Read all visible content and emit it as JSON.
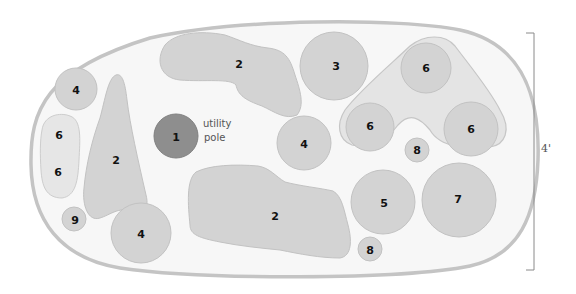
{
  "diagram": {
    "type": "planting plan",
    "bed_shape": "rounded oval",
    "colors": {
      "bed_fill": "#f7f7f7",
      "bed_stroke": "#c4c4c4",
      "plant_fill": "#d3d3d3",
      "plant_light_fill": "#e6e6e6",
      "pole_fill": "#8e8e8e",
      "label": "#111111"
    },
    "plants": [
      {
        "id": "p1",
        "label": "1",
        "shape": "circle",
        "note": "utility pole"
      },
      {
        "id": "p2a",
        "label": "2",
        "shape": "blob-top"
      },
      {
        "id": "p2b",
        "label": "2",
        "shape": "teardrop-left"
      },
      {
        "id": "p2c",
        "label": "2",
        "shape": "blob-bottom"
      },
      {
        "id": "p3",
        "label": "3",
        "shape": "circle"
      },
      {
        "id": "p4a",
        "label": "4",
        "shape": "circle"
      },
      {
        "id": "p4b",
        "label": "4",
        "shape": "circle"
      },
      {
        "id": "p4c",
        "label": "4",
        "shape": "circle"
      },
      {
        "id": "p5",
        "label": "5",
        "shape": "circle"
      },
      {
        "id": "p6a",
        "label": "6",
        "shape": "circle"
      },
      {
        "id": "p6b",
        "label": "6",
        "shape": "circle"
      },
      {
        "id": "p6c",
        "label": "6",
        "shape": "circle"
      },
      {
        "id": "p6d",
        "label": "6",
        "shape": "pill"
      },
      {
        "id": "p6e",
        "label": "6",
        "shape": "pill"
      },
      {
        "id": "p7",
        "label": "7",
        "shape": "circle"
      },
      {
        "id": "p8a",
        "label": "8",
        "shape": "circle"
      },
      {
        "id": "p8b",
        "label": "8",
        "shape": "circle"
      },
      {
        "id": "p9",
        "label": "9",
        "shape": "circle"
      }
    ],
    "annotations": {
      "pole_line1": "utility",
      "pole_line2": "pole"
    },
    "dimension": {
      "label": "4'",
      "orientation": "vertical"
    }
  }
}
